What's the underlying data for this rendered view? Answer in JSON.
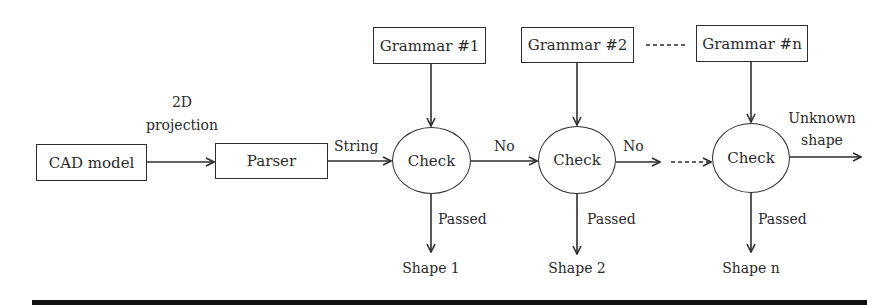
{
  "diagram": {
    "type": "flowchart",
    "colors": {
      "stroke": "#2e2e2e",
      "text": "#2a2a2a",
      "background": "#ffffff",
      "bottom_bar": "#111111"
    },
    "nodes": {
      "cad_model": {
        "label": "CAD model"
      },
      "parser": {
        "label": "Parser"
      },
      "grammar_1": {
        "label": "Grammar #1"
      },
      "grammar_2": {
        "label": "Grammar #2"
      },
      "grammar_n": {
        "label": "Grammar #n"
      },
      "check_1": {
        "label": "Check"
      },
      "check_2": {
        "label": "Check"
      },
      "check_n": {
        "label": "Check"
      }
    },
    "edge_labels": {
      "projection_line1": "2D",
      "projection_line2": "projection",
      "string": "String",
      "no_1": "No",
      "no_2": "No",
      "unknown_line1": "Unknown",
      "unknown_line2": "shape",
      "passed_1": "Passed",
      "passed_2": "Passed",
      "passed_n": "Passed"
    },
    "outputs": {
      "shape_1": "Shape 1",
      "shape_2": "Shape 2",
      "shape_n": "Shape n"
    },
    "edges": [
      {
        "from": "cad_model",
        "to": "parser",
        "label": "2D projection",
        "style": "solid"
      },
      {
        "from": "parser",
        "to": "check_1",
        "label": "String",
        "style": "solid"
      },
      {
        "from": "grammar_1",
        "to": "check_1",
        "style": "solid"
      },
      {
        "from": "grammar_2",
        "to": "check_2",
        "style": "solid"
      },
      {
        "from": "grammar_n",
        "to": "check_n",
        "style": "solid"
      },
      {
        "from": "check_1",
        "to": "check_2",
        "label": "No",
        "style": "solid"
      },
      {
        "from": "check_2",
        "to": "continuation",
        "label": "No",
        "style": "solid"
      },
      {
        "from": "continuation",
        "to": "check_n",
        "style": "dashed"
      },
      {
        "from": "grammar_2",
        "to": "grammar_n",
        "style": "dashed",
        "arrow": false
      },
      {
        "from": "check_1",
        "to": "shape_1",
        "label": "Passed",
        "style": "solid"
      },
      {
        "from": "check_2",
        "to": "shape_2",
        "label": "Passed",
        "style": "solid"
      },
      {
        "from": "check_n",
        "to": "shape_n",
        "label": "Passed",
        "style": "solid"
      },
      {
        "from": "check_n",
        "to": "exit",
        "label": "Unknown shape",
        "style": "solid"
      }
    ]
  }
}
